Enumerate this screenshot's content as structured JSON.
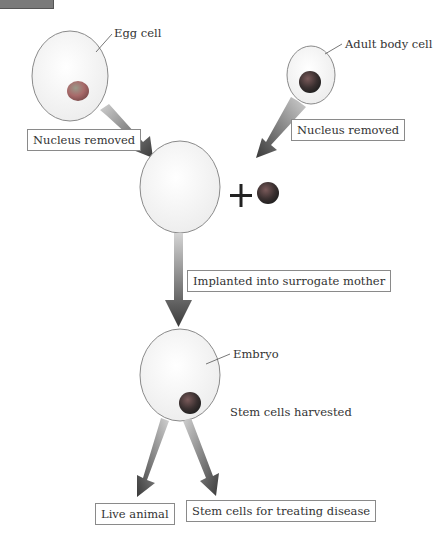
{
  "diagram": {
    "type": "flow",
    "topic": "Somatic cell nuclear transfer (cloning)",
    "nodes": {
      "egg_cell": {
        "label": "Egg cell"
      },
      "adult_body_cell": {
        "label": "Adult body cell"
      },
      "nucleus_removed_left": {
        "label": "Nucleus removed"
      },
      "nucleus_removed_right": {
        "label": "Nucleus removed"
      },
      "combine_symbol": "+",
      "implanted": {
        "label": "Implanted into surrogate mother"
      },
      "embryo": {
        "label": "Embryo"
      },
      "stem_cells_harvested": {
        "label": "Stem cells harvested"
      },
      "live_animal": {
        "label": "Live animal"
      },
      "stem_cells_disease": {
        "label": "Stem cells for treating disease"
      }
    },
    "edges": [
      {
        "from": "egg_cell",
        "to": "enucleated_egg",
        "via": "nucleus_removed_left"
      },
      {
        "from": "adult_body_cell",
        "to": "enucleated_egg",
        "via": "nucleus_removed_right"
      },
      {
        "from": "enucleated_egg",
        "to": "embryo",
        "via": "implanted"
      },
      {
        "from": "embryo",
        "to": "live_animal"
      },
      {
        "from": "embryo",
        "to": "stem_cells_disease"
      }
    ],
    "colors": {
      "cell_fill": "#f4f4f4",
      "cell_stroke": "#8a8a8a",
      "egg_nucleus": "#b86464",
      "dark_nucleus": "#3a3a3a",
      "arrow_dark": "#3c3c3c",
      "arrow_light": "#c8c8c8"
    }
  }
}
